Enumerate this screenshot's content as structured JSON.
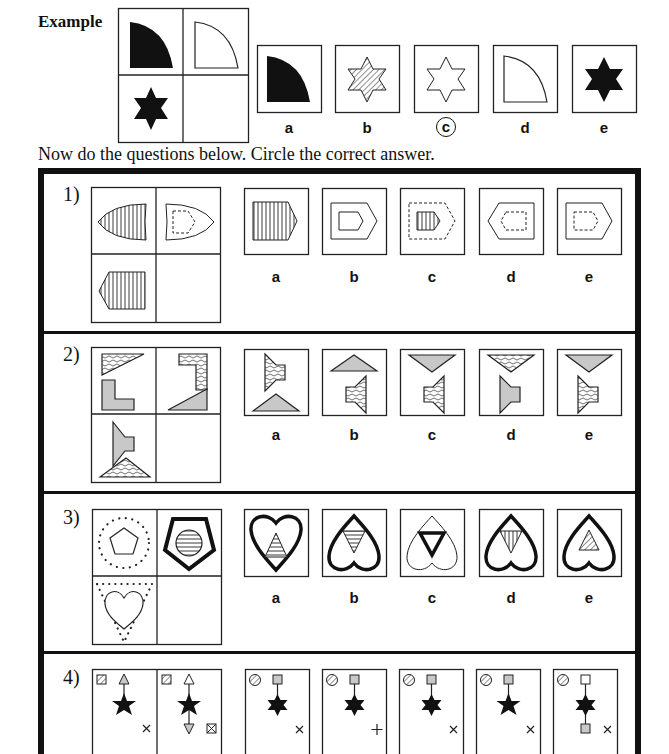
{
  "header": {
    "example_label": "Example",
    "instruction": "Now do the questions below. Circle the correct answer."
  },
  "example": {
    "grid": [
      "black quarter-circle",
      "white quarter-circle",
      "black six-point star",
      "empty"
    ],
    "options": [
      {
        "label": "a",
        "figure": "black quarter-circle"
      },
      {
        "label": "b",
        "figure": "hatched six-point star"
      },
      {
        "label": "c",
        "figure": "white six-point star",
        "circled": true
      },
      {
        "label": "d",
        "figure": "white quarter-circle"
      },
      {
        "label": "e",
        "figure": "black six-point star"
      }
    ],
    "answer": "c"
  },
  "questions": [
    {
      "number": "1)",
      "grid": [
        "striped shield pointing left",
        "white shield pointing right with dashed inner shape",
        "striped pentagon pointing left",
        "empty"
      ],
      "options": [
        {
          "label": "a",
          "figure": "striped pentagon pointing right"
        },
        {
          "label": "b",
          "figure": "pentagon inside pentagon"
        },
        {
          "label": "c",
          "figure": "dashed pentagon with striped inner pentagon"
        },
        {
          "label": "d",
          "figure": "pentagon pointing left with dashed inner"
        },
        {
          "label": "e",
          "figure": "pentagon pointing right with dashed inner"
        }
      ]
    },
    {
      "number": "2)",
      "grid": [
        "textured triangle over grey L",
        "textured L over grey triangle",
        "grey trapezoid over textured triangle",
        "empty"
      ],
      "options": [
        {
          "label": "a",
          "figure": "textured trapezoid over grey triangle"
        },
        {
          "label": "b",
          "figure": "grey triangle over textured trapezoid"
        },
        {
          "label": "c",
          "figure": "grey inverted triangle over textured trapezoid"
        },
        {
          "label": "d",
          "figure": "textured inverted triangle over grey trapezoid"
        },
        {
          "label": "e",
          "figure": "grey inverted triangle over textured trapezoid"
        }
      ]
    },
    {
      "number": "3)",
      "grid": [
        "pentagon in dotted circle",
        "bold pentagon with striped circle",
        "heart in dotted triangle",
        "empty"
      ],
      "options": [
        {
          "label": "a",
          "figure": "bold heart with striped triangle"
        },
        {
          "label": "b",
          "figure": "bold inverted heart with striped inverted triangle"
        },
        {
          "label": "c",
          "figure": "thin inverted heart with bold inverted triangle"
        },
        {
          "label": "d",
          "figure": "bold inverted heart with vertical-striped inverted triangle"
        },
        {
          "label": "e",
          "figure": "bold inverted heart with hatched triangle"
        }
      ]
    },
    {
      "number": "4)",
      "grid": [
        "hatched square, grey arrow up, star, cross",
        "hatched square, arrows up and down, star, boxed cross"
      ],
      "options": [
        {
          "label": "a",
          "figure": "hatched circle, grey square, 6-point star, cross"
        },
        {
          "label": "b",
          "figure": "hatched circle, grey square, 6-point star, plus"
        },
        {
          "label": "c",
          "figure": "hatched circle, grey square, 6-point star, cross"
        },
        {
          "label": "d",
          "figure": "hatched circle, grey square, 5-point star, cross"
        },
        {
          "label": "e",
          "figure": "hatched circle, white square, 6-point star, grey square, cross"
        }
      ]
    }
  ],
  "colors": {
    "ink": "#111111",
    "grey_fill": "#c8c8c8",
    "background": "#ffffff"
  }
}
